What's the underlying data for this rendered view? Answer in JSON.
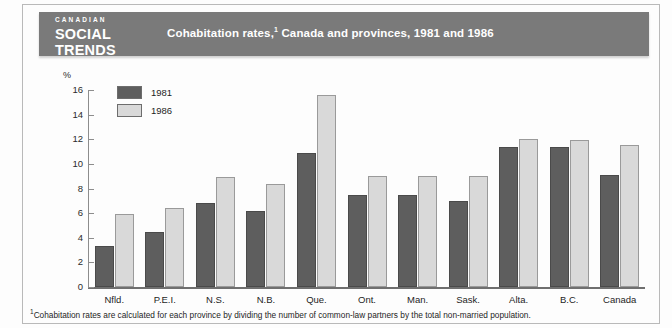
{
  "brand": {
    "line1": "CANADIAN",
    "line2": "SOCIAL",
    "line3": "TRENDS"
  },
  "header": {
    "title": "Cohabitation rates,",
    "title_footnote_marker": "1",
    "title_rest": " Canada and provinces, 1981 and 1986"
  },
  "legend": {
    "items": [
      {
        "label": "1981",
        "color": "#5e5e5e"
      },
      {
        "label": "1986",
        "color": "#d9d9d9"
      }
    ]
  },
  "axis": {
    "unit_label": "%",
    "ticks": [
      "0",
      "2",
      "4",
      "6",
      "8",
      "10",
      "12",
      "14",
      "16"
    ]
  },
  "footnote": {
    "marker": "1",
    "text": "Cohabitation rates are calculated for each province by dividing the number of common-law partners by the total non-married population."
  },
  "colors": {
    "header_band": "#7a7a7a",
    "bar_1981": "#5e5e5e",
    "bar_1986": "#d9d9d9",
    "axis": "#8d8d8d",
    "page": "#fdfdfd"
  },
  "chart_data": {
    "type": "bar",
    "xlabel": "",
    "ylabel": "%",
    "ylim": [
      0,
      16
    ],
    "ytick_step": 2,
    "grid": false,
    "legend_position": "top-left-inside",
    "categories": [
      "Nfld.",
      "P.E.I.",
      "N.S.",
      "N.B.",
      "Que.",
      "Ont.",
      "Man.",
      "Sask.",
      "Alta.",
      "B.C.",
      "Canada"
    ],
    "series": [
      {
        "name": "1981",
        "color": "#5e5e5e",
        "values": [
          3.3,
          4.5,
          6.8,
          6.2,
          10.9,
          7.5,
          7.5,
          7.0,
          11.4,
          11.4,
          9.1
        ]
      },
      {
        "name": "1986",
        "color": "#d9d9d9",
        "values": [
          5.9,
          6.4,
          8.9,
          8.4,
          15.6,
          9.0,
          9.0,
          9.0,
          12.0,
          11.9,
          11.5
        ]
      }
    ]
  }
}
